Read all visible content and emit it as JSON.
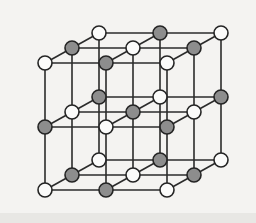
{
  "figure": {
    "background_color": "#f4f3f1",
    "bond_color": "#2b2b2b",
    "outline_color": "#242424",
    "light_atom_color": "#fbfbfa",
    "dark_atom_color": "#8d8d8d",
    "atom_radius": 7,
    "bond_width": 1.6
  },
  "lattice": {
    "type": "cubic",
    "dimensions": {
      "columns": 3,
      "rows": 3,
      "layers": 3
    },
    "projection": {
      "column_step_x": 61,
      "row_step_y": 63,
      "depth_step_x": 27,
      "depth_step_y": -15,
      "origin_x": 45,
      "origin_y": 190
    },
    "atom_count": 27,
    "light_atom_count": 14,
    "dark_atom_count": 13,
    "atoms": [
      {
        "id": "a-0-0-0",
        "col": 0,
        "row": 0,
        "layer": 0,
        "x": 45,
        "y": 190,
        "kind": "light"
      },
      {
        "id": "a-1-0-0",
        "col": 1,
        "row": 0,
        "layer": 0,
        "x": 106,
        "y": 190,
        "kind": "dark"
      },
      {
        "id": "a-2-0-0",
        "col": 2,
        "row": 0,
        "layer": 0,
        "x": 167,
        "y": 190,
        "kind": "light"
      },
      {
        "id": "a-0-0-1",
        "col": 0,
        "row": 0,
        "layer": 1,
        "x": 72,
        "y": 175,
        "kind": "dark"
      },
      {
        "id": "a-1-0-1",
        "col": 1,
        "row": 0,
        "layer": 1,
        "x": 133,
        "y": 175,
        "kind": "light"
      },
      {
        "id": "a-2-0-1",
        "col": 2,
        "row": 0,
        "layer": 1,
        "x": 194,
        "y": 175,
        "kind": "dark"
      },
      {
        "id": "a-0-0-2",
        "col": 0,
        "row": 0,
        "layer": 2,
        "x": 99,
        "y": 160,
        "kind": "light"
      },
      {
        "id": "a-1-0-2",
        "col": 1,
        "row": 0,
        "layer": 2,
        "x": 160,
        "y": 160,
        "kind": "dark"
      },
      {
        "id": "a-2-0-2",
        "col": 2,
        "row": 0,
        "layer": 2,
        "x": 221,
        "y": 160,
        "kind": "light"
      },
      {
        "id": "a-0-1-0",
        "col": 0,
        "row": 1,
        "layer": 0,
        "x": 45,
        "y": 127,
        "kind": "dark"
      },
      {
        "id": "a-1-1-0",
        "col": 1,
        "row": 1,
        "layer": 0,
        "x": 106,
        "y": 127,
        "kind": "light"
      },
      {
        "id": "a-2-1-0",
        "col": 2,
        "row": 1,
        "layer": 0,
        "x": 167,
        "y": 127,
        "kind": "dark"
      },
      {
        "id": "a-0-1-1",
        "col": 0,
        "row": 1,
        "layer": 1,
        "x": 72,
        "y": 112,
        "kind": "light"
      },
      {
        "id": "a-1-1-1",
        "col": 1,
        "row": 1,
        "layer": 1,
        "x": 133,
        "y": 112,
        "kind": "dark"
      },
      {
        "id": "a-2-1-1",
        "col": 2,
        "row": 1,
        "layer": 1,
        "x": 194,
        "y": 112,
        "kind": "light"
      },
      {
        "id": "a-0-1-2",
        "col": 0,
        "row": 1,
        "layer": 2,
        "x": 99,
        "y": 97,
        "kind": "dark"
      },
      {
        "id": "a-1-1-2",
        "col": 1,
        "row": 1,
        "layer": 2,
        "x": 160,
        "y": 97,
        "kind": "light"
      },
      {
        "id": "a-2-1-2",
        "col": 2,
        "row": 1,
        "layer": 2,
        "x": 221,
        "y": 97,
        "kind": "dark"
      },
      {
        "id": "a-0-2-0",
        "col": 0,
        "row": 2,
        "layer": 0,
        "x": 45,
        "y": 63,
        "kind": "light"
      },
      {
        "id": "a-1-2-0",
        "col": 1,
        "row": 2,
        "layer": 0,
        "x": 106,
        "y": 63,
        "kind": "dark"
      },
      {
        "id": "a-2-2-0",
        "col": 2,
        "row": 2,
        "layer": 0,
        "x": 167,
        "y": 63,
        "kind": "light"
      },
      {
        "id": "a-0-2-1",
        "col": 0,
        "row": 2,
        "layer": 1,
        "x": 72,
        "y": 48,
        "kind": "dark"
      },
      {
        "id": "a-1-2-1",
        "col": 1,
        "row": 2,
        "layer": 1,
        "x": 133,
        "y": 48,
        "kind": "light"
      },
      {
        "id": "a-2-2-1",
        "col": 2,
        "row": 2,
        "layer": 1,
        "x": 194,
        "y": 48,
        "kind": "dark"
      },
      {
        "id": "a-0-2-2",
        "col": 0,
        "row": 2,
        "layer": 2,
        "x": 99,
        "y": 33,
        "kind": "light"
      },
      {
        "id": "a-1-2-2",
        "col": 1,
        "row": 2,
        "layer": 2,
        "x": 160,
        "y": 33,
        "kind": "dark"
      },
      {
        "id": "a-2-2-2",
        "col": 2,
        "row": 2,
        "layer": 2,
        "x": 221,
        "y": 33,
        "kind": "light"
      }
    ]
  }
}
